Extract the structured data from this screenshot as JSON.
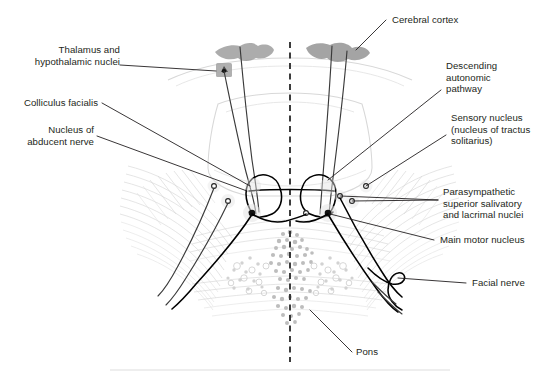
{
  "figure": {
    "type": "anatomical-diagram",
    "region": "pons / brainstem transverse section",
    "background_color": "#ffffff",
    "text_color": "#231f20"
  },
  "labels": {
    "thalamus": "Thalamus and\nhypothalamic nuclei",
    "colliculus": "Colliculus facialis",
    "abducent": "Nucleus of\nabducent nerve",
    "cerebral_cortex": "Cerebral cortex",
    "descending": "Descending\nautonomic\npathway",
    "sensory": "Sensory nucleus\n(nucleus of tractus\nsolitarius)",
    "parasympathetic": "Parasympathetic\nsuperior salivatory\nand lacrimal nuclei",
    "main_motor": "Main motor nucleus",
    "facial_nerve": "Facial nerve",
    "pons": "Pons"
  },
  "structures": {
    "midline_name": "midline-dashed-axis",
    "cortex_name": "cerebral-cortex-shape",
    "thalamus_name": "thalamic-nucleus-marker",
    "colliculus_name": "colliculus-facialis-loop",
    "abducent_name": "abducent-nucleus-marker",
    "motor_name": "main-motor-nucleus-marker",
    "sensory_name": "sensory-nucleus-marker",
    "parasympathetic_name": "parasympathetic-nucleus-marker",
    "facial_name": "facial-nerve-fiber",
    "pons_name": "pons-body"
  },
  "colors": {
    "ink": "#231f20",
    "tract": "#000000",
    "gray_structure": "#9a9a9a",
    "faint_outline": "#d8d8d8",
    "speckle": "#bdbdbd"
  }
}
